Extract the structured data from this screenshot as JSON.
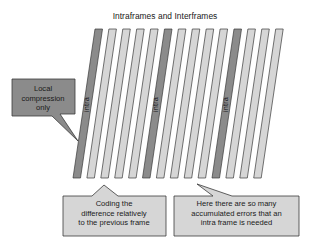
{
  "figure": {
    "title": "Intraframes and Interframes",
    "background_color": "#ffffff"
  },
  "palette": {
    "frame_light_fill": "#d6d6d6",
    "frame_light_top": "#c9c9c9",
    "frame_intra_fill": "#8b8b8b",
    "frame_intra_top": "#7e7e7e",
    "callout_dark_fill": "#8b8b8b",
    "callout_light_fill": "#d6d6d6",
    "outline": "#3a3a3a",
    "text_color": "#1a1a1a"
  },
  "frames": {
    "count": 14,
    "intra_indices": [
      0,
      5,
      10
    ],
    "intra_label": "intra",
    "labels": [
      "intra",
      "inter",
      "inter",
      "inter",
      "inter",
      "intra",
      "inter",
      "inter",
      "inter",
      "inter",
      "intra",
      "inter",
      "inter",
      "inter"
    ]
  },
  "callouts": {
    "local": {
      "name": "local-compression-callout",
      "text": "Local\ncompression\nonly",
      "style": "dark",
      "points_to": "first-intra-frame"
    },
    "coding": {
      "name": "coding-difference-callout",
      "text": "Coding the\ndifference relatively\nto the previous frame",
      "style": "light",
      "points_to": "interframe-group-left"
    },
    "errors": {
      "name": "accumulated-errors-callout",
      "text": "Here there are so many\naccumulated errors that an\nintra frame is needed",
      "style": "light",
      "points_to": "third-intra-frame"
    }
  }
}
